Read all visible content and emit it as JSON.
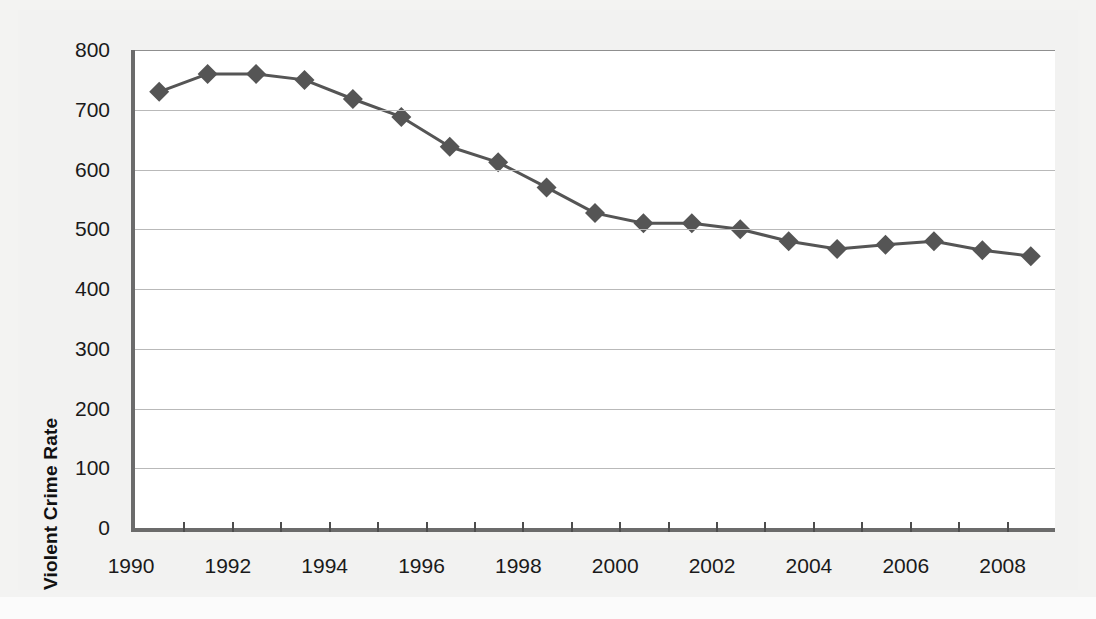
{
  "chart_data": {
    "type": "line",
    "title": "",
    "xlabel": "",
    "ylabel": "Violent Crime Rate",
    "ylim": [
      0,
      800
    ],
    "xlim": [
      1990,
      2009
    ],
    "ytick_step": 100,
    "yticks": [
      "800",
      "700",
      "600",
      "500",
      "400",
      "300",
      "200",
      "100",
      "0"
    ],
    "xticks": [
      "1990",
      "1992",
      "1994",
      "1996",
      "1998",
      "2000",
      "2002",
      "2004",
      "2006",
      "2008"
    ],
    "xtick_values": [
      1990,
      1992,
      1994,
      1996,
      1998,
      2000,
      2002,
      2004,
      2006,
      2008
    ],
    "grid": true,
    "legend": false,
    "marker": "diamond",
    "series_color": "#555555",
    "x": [
      1990.5,
      1991.5,
      1992.5,
      1993.5,
      1994.5,
      1995.5,
      1996.5,
      1997.5,
      1998.5,
      1999.5,
      2000.5,
      2001.5,
      2002.5,
      2003.5,
      2004.5,
      2005.5,
      2006.5,
      2007.5,
      2008.5
    ],
    "categories": [
      "1990",
      "1991",
      "1992",
      "1993",
      "1994",
      "1995",
      "1996",
      "1997",
      "1998",
      "1999",
      "2000",
      "2001",
      "2002",
      "2003",
      "2004",
      "2005",
      "2006",
      "2007",
      "2008"
    ],
    "values": [
      730,
      760,
      760,
      750,
      718,
      688,
      638,
      612,
      570,
      527,
      510,
      510,
      500,
      480,
      467,
      474,
      480,
      465,
      455
    ],
    "series": [
      {
        "name": "Violent Crime Rate",
        "values": [
          730,
          760,
          760,
          750,
          718,
          688,
          638,
          612,
          570,
          527,
          510,
          510,
          500,
          480,
          467,
          474,
          480,
          465,
          455
        ]
      }
    ]
  },
  "figure": {
    "background_color": "#f2f2f1",
    "plot_background_color": "#ffffff",
    "axis_color": "#6b6b6b",
    "gridline_color": "#b9b9b9"
  }
}
